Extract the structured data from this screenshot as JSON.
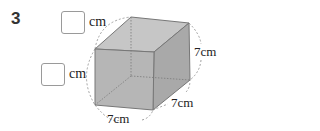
{
  "problem": {
    "number": "3"
  },
  "answers": [
    {
      "id": "top-length",
      "value": "",
      "unit": "cm"
    },
    {
      "id": "left-length",
      "value": "",
      "unit": "cm"
    }
  ],
  "cube": {
    "dimensions": {
      "height": "7cm",
      "depth": "7cm",
      "width": "7cm"
    },
    "colors": {
      "front_face": "#b3b3b3",
      "top_face": "#c4c4c4",
      "side_face": "#a6a6a6",
      "edge": "#777777",
      "dashed": "#888888"
    }
  }
}
